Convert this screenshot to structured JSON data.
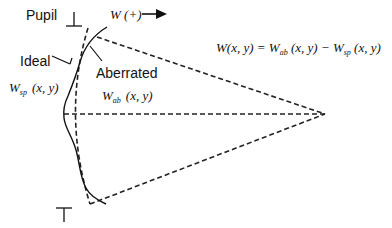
{
  "diagram": {
    "labels": {
      "pupil": "Pupil",
      "ideal": "Ideal",
      "aberrated": "Aberrated",
      "w_direction": "W (+)",
      "w_sp_main": "W",
      "w_sp_sub": "sp",
      "w_sp_args": "(x, y)",
      "w_ab_main": "W",
      "w_ab_sub": "ab",
      "w_ab_args": "(x, y)"
    },
    "equation": {
      "lhs": "W(x, y) = ",
      "term1_main": "W",
      "term1_sub": "ab",
      "term1_args": " (x, y) − ",
      "term2_main": "W",
      "term2_sub": "sp",
      "term2_args": " (x, y)"
    },
    "icons": {
      "pupil_top_marker": "perpendicular-up-tack",
      "pupil_bottom_marker": "down-tack",
      "direction_arrow": "right-arrow"
    },
    "colors": {
      "ink": "#111111",
      "background": "#ffffff"
    }
  }
}
